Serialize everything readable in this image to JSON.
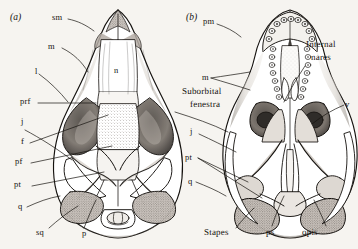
{
  "figure": {
    "background_color": "#f6f4f0",
    "ink_color": "#15120f",
    "panels": [
      {
        "id": "panel-a",
        "caption": "(a)",
        "view": "dorsal skull"
      },
      {
        "id": "panel-b",
        "caption": "(b)",
        "view": "ventral skull"
      }
    ]
  },
  "panel_a": {
    "caption": "(a)",
    "labels": {
      "sm": "sm",
      "m": "m",
      "l": "l",
      "n": "n",
      "prf": "prf",
      "j": "j",
      "f": "f",
      "pf": "pf",
      "pt": "pt",
      "q": "q",
      "sq": "sq",
      "p": "p"
    }
  },
  "panel_b": {
    "caption": "(b)",
    "labels": {
      "pm": "pm",
      "m": "m",
      "internal_nares_line1": "Internal",
      "internal_nares_line2": "nares",
      "v": "v",
      "suborbital_line1": "Suborbital",
      "suborbital_line2": "fenestra",
      "j": "j",
      "pt": "pt",
      "q": "q",
      "stapes": "Stapes",
      "ps": "ps",
      "opis": "opis"
    }
  }
}
